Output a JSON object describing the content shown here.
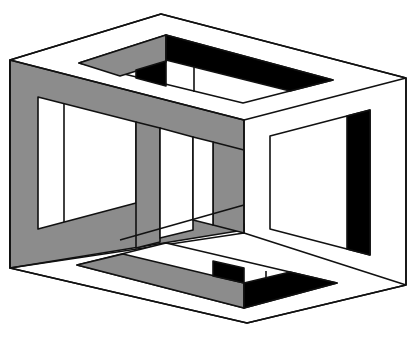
{
  "figure": {
    "title": "Impossible cube"
  },
  "colors": {
    "background": "#ffffff",
    "white_face": "#ffffff",
    "grey_face": "#8c8c8c",
    "black_face": "#000000",
    "stroke": "#111111"
  }
}
